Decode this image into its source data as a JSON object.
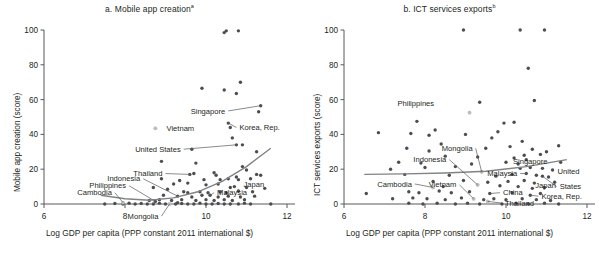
{
  "figure": {
    "xaxis_title": "Log GDP per capita (PPP constant 2011 international $)"
  },
  "chart_data": [
    {
      "type": "scatter",
      "panel": "a",
      "title": "a. Mobile app creation",
      "title_superscript": "a",
      "xlabel": "Log GDP per capita (PPP constant 2011 international $)",
      "ylabel": "Mobile app creation (score)",
      "xlim": [
        6,
        12
      ],
      "ylim": [
        0,
        100
      ],
      "xticks": [
        6,
        8,
        10,
        12
      ],
      "yticks": [
        0,
        20,
        40,
        60,
        80,
        100
      ],
      "grid": false,
      "legend": "none",
      "marker_color": "#4d4d4f",
      "highlight_color": "#bcbec0",
      "trendline_color": "#808285",
      "trendline": {
        "note": "fitted upward-curving trend",
        "x": [
          7.4,
          8.0,
          8.6,
          9.2,
          9.8,
          10.4,
          11.0,
          11.6
        ],
        "y": [
          5.0,
          3.0,
          2.2,
          3.5,
          7.0,
          13.0,
          21.5,
          32.0
        ]
      },
      "annotations": [
        {
          "label": "Singapore",
          "x": 11.35,
          "y": 56.5,
          "lx": 10.55,
          "ly": 53.5,
          "leader": true
        },
        {
          "label": "Korea, Rep.",
          "x": 10.55,
          "y": 46.5,
          "lx": 10.75,
          "ly": 44.0,
          "leader": true
        },
        {
          "label": "Vietnam",
          "x": 8.75,
          "y": 43.5,
          "lx": 8.95,
          "ly": 43.5,
          "leader": false,
          "muted": true
        },
        {
          "label": "United States",
          "x": 10.75,
          "y": 34.0,
          "lx": 9.45,
          "ly": 31.5,
          "leader": true
        },
        {
          "label": "Thailand",
          "x": 9.6,
          "y": 17.0,
          "lx": 9.0,
          "ly": 17.5,
          "leader": true
        },
        {
          "label": "Indonesia",
          "x": 9.3,
          "y": 4.5,
          "lx": 8.45,
          "ly": 14.5,
          "leader": true
        },
        {
          "label": "Philippines",
          "x": 8.75,
          "y": 1.5,
          "lx": 8.1,
          "ly": 10.5,
          "leader": true
        },
        {
          "label": "Cambodia",
          "x": 7.95,
          "y": 0.8,
          "lx": 7.75,
          "ly": 6.5,
          "leader": true
        },
        {
          "label": "Japan",
          "x": 10.6,
          "y": 9.5,
          "lx": 10.85,
          "ly": 11.0,
          "leader": false
        },
        {
          "label": "Malaysia",
          "x": 10.1,
          "y": 5.0,
          "lx": 10.2,
          "ly": 6.5,
          "leader": true
        },
        {
          "label": "Mongolia",
          "x": 9.1,
          "y": 0.0,
          "lx": 8.9,
          "ly": -7.0,
          "leader": true
        }
      ],
      "points": [
        [
          10.45,
          98.5
        ],
        [
          10.5,
          99.5
        ],
        [
          10.8,
          99.5
        ],
        [
          9.9,
          66.5
        ],
        [
          10.45,
          65.5
        ],
        [
          10.85,
          70.0
        ],
        [
          10.75,
          63.5
        ],
        [
          11.35,
          56.5
        ],
        [
          11.3,
          53.0
        ],
        [
          10.55,
          46.5
        ],
        [
          10.6,
          44.0
        ],
        [
          8.75,
          43.5
        ],
        [
          10.65,
          38.0
        ],
        [
          10.9,
          34.0
        ],
        [
          10.75,
          34.0
        ],
        [
          9.65,
          31.5
        ],
        [
          11.25,
          30.0
        ],
        [
          8.9,
          24.5
        ],
        [
          9.75,
          23.5
        ],
        [
          10.9,
          21.5
        ],
        [
          11.0,
          19.5
        ],
        [
          11.25,
          17.0
        ],
        [
          11.35,
          16.5
        ],
        [
          9.6,
          17.0
        ],
        [
          9.7,
          17.5
        ],
        [
          10.2,
          18.0
        ],
        [
          10.25,
          16.5
        ],
        [
          8.9,
          14.5
        ],
        [
          9.35,
          13.5
        ],
        [
          9.95,
          14.0
        ],
        [
          10.35,
          14.0
        ],
        [
          10.55,
          14.5
        ],
        [
          10.75,
          15.5
        ],
        [
          10.8,
          14.0
        ],
        [
          11.1,
          14.5
        ],
        [
          9.2,
          11.5
        ],
        [
          9.55,
          12.0
        ],
        [
          10.0,
          11.0
        ],
        [
          10.3,
          11.5
        ],
        [
          10.6,
          9.5
        ],
        [
          10.7,
          10.0
        ],
        [
          11.0,
          9.5
        ],
        [
          11.45,
          9.0
        ],
        [
          8.7,
          9.5
        ],
        [
          9.05,
          8.5
        ],
        [
          9.45,
          7.0
        ],
        [
          9.55,
          6.5
        ],
        [
          9.85,
          7.0
        ],
        [
          10.05,
          6.5
        ],
        [
          10.35,
          7.0
        ],
        [
          10.5,
          6.5
        ],
        [
          10.8,
          7.5
        ],
        [
          11.15,
          7.0
        ],
        [
          8.95,
          5.0
        ],
        [
          9.3,
          4.5
        ],
        [
          9.65,
          4.0
        ],
        [
          9.9,
          5.0
        ],
        [
          10.1,
          5.0
        ],
        [
          10.3,
          4.0
        ],
        [
          10.55,
          4.5
        ],
        [
          10.85,
          4.0
        ],
        [
          11.2,
          4.5
        ],
        [
          8.6,
          2.0
        ],
        [
          8.85,
          2.5
        ],
        [
          9.15,
          2.0
        ],
        [
          9.4,
          2.5
        ],
        [
          9.75,
          2.0
        ],
        [
          10.0,
          2.5
        ],
        [
          10.2,
          2.0
        ],
        [
          10.45,
          2.5
        ],
        [
          10.65,
          2.0
        ],
        [
          10.95,
          2.5
        ],
        [
          7.5,
          0.0
        ],
        [
          7.75,
          0.3
        ],
        [
          7.95,
          0.0
        ],
        [
          8.1,
          0.5
        ],
        [
          8.25,
          0.0
        ],
        [
          8.4,
          0.3
        ],
        [
          8.55,
          0.0
        ],
        [
          8.7,
          0.0
        ],
        [
          8.85,
          0.5
        ],
        [
          9.0,
          0.0
        ],
        [
          9.1,
          0.0
        ],
        [
          9.25,
          0.0
        ],
        [
          9.4,
          0.3
        ],
        [
          9.55,
          0.0
        ],
        [
          9.7,
          0.0
        ],
        [
          9.85,
          0.5
        ],
        [
          10.0,
          0.0
        ],
        [
          10.15,
          0.0
        ],
        [
          10.3,
          0.3
        ],
        [
          10.45,
          0.0
        ],
        [
          10.6,
          0.0
        ],
        [
          10.8,
          0.0
        ],
        [
          10.95,
          0.5
        ],
        [
          11.1,
          0.0
        ],
        [
          11.6,
          0.0
        ],
        [
          8.75,
          1.5
        ],
        [
          9.3,
          0.8
        ]
      ],
      "highlight_points": [
        [
          8.75,
          43.5
        ],
        [
          7.95,
          0.8
        ],
        [
          9.1,
          0.0
        ]
      ]
    },
    {
      "type": "scatter",
      "panel": "b",
      "title": "b. ICT services exports",
      "title_superscript": "b",
      "xlabel": "Log GDP per capita (PPP constant 2011 international $)",
      "ylabel": "ICT services exports (score)",
      "xlim": [
        6,
        12
      ],
      "ylim": [
        0,
        100
      ],
      "xticks": [
        6,
        8,
        10,
        12
      ],
      "yticks": [
        0,
        20,
        40,
        60,
        80,
        100
      ],
      "grid": false,
      "legend": "none",
      "marker_color": "#4d4d4f",
      "highlight_color": "#bcbec0",
      "trendline_color": "#808285",
      "trendline": {
        "note": "fitted nearly flat, slightly rising trend",
        "x": [
          6.5,
          7.5,
          8.5,
          9.5,
          10.5,
          11.5
        ],
        "y": [
          17.0,
          17.3,
          17.8,
          18.8,
          21.5,
          25.5
        ]
      },
      "annotations": [
        {
          "label": "Philippines",
          "x": 9.1,
          "y": 52.5,
          "lx": 8.3,
          "ly": 58.0,
          "leader": false,
          "muted": true
        },
        {
          "label": "Mongolia",
          "x": 9.4,
          "y": 18.5,
          "lx": 9.25,
          "ly": 32.0,
          "leader": true
        },
        {
          "label": "Indonesia",
          "x": 9.3,
          "y": 11.0,
          "lx": 8.6,
          "ly": 25.5,
          "leader": true
        },
        {
          "label": "Singapore",
          "x": 11.35,
          "y": 24.0,
          "lx": 11.1,
          "ly": 24.5,
          "leader": false
        },
        {
          "label": "Malaysia",
          "x": 10.5,
          "y": 17.5,
          "lx": 10.35,
          "ly": 17.5,
          "leader": true
        },
        {
          "label": "United",
          "x": 10.9,
          "y": 16.0,
          "lx": 11.2,
          "ly": 18.5,
          "leader": false
        },
        {
          "label": "States",
          "x": 10.9,
          "y": 16.0,
          "lx": 11.25,
          "ly": 10.0,
          "leader": true
        },
        {
          "label": "Japan",
          "x": 10.65,
          "y": 9.0,
          "lx": 10.65,
          "ly": 10.5,
          "leader": false
        },
        {
          "label": "Korea, Rep.",
          "x": 10.6,
          "y": 5.0,
          "lx": 10.8,
          "ly": 4.5,
          "leader": true
        },
        {
          "label": "China",
          "x": 9.6,
          "y": 6.0,
          "lx": 9.85,
          "ly": 6.5,
          "leader": true
        },
        {
          "label": "Thailand",
          "x": 9.55,
          "y": 1.5,
          "lx": 9.9,
          "ly": 0.5,
          "leader": true
        },
        {
          "label": "Vietnam",
          "x": 9.2,
          "y": 3.0,
          "lx": 8.85,
          "ly": 11.0,
          "leader": true
        },
        {
          "label": "Cambodia",
          "x": 8.2,
          "y": 9.5,
          "lx": 7.75,
          "ly": 11.5,
          "leader": true
        }
      ],
      "points": [
        [
          8.95,
          100.0
        ],
        [
          10.35,
          100.0
        ],
        [
          10.95,
          100.0
        ],
        [
          10.55,
          78.0
        ],
        [
          9.35,
          58.5
        ],
        [
          10.7,
          59.5
        ],
        [
          9.1,
          52.5
        ],
        [
          7.8,
          47.5
        ],
        [
          9.95,
          46.5
        ],
        [
          7.65,
          40.5
        ],
        [
          10.2,
          47.0
        ],
        [
          6.85,
          41.0
        ],
        [
          8.25,
          42.5
        ],
        [
          8.1,
          39.5
        ],
        [
          9.0,
          40.0
        ],
        [
          9.8,
          41.5
        ],
        [
          8.4,
          34.5
        ],
        [
          9.65,
          38.0
        ],
        [
          10.4,
          36.0
        ],
        [
          11.3,
          33.5
        ],
        [
          7.55,
          32.0
        ],
        [
          8.1,
          30.5
        ],
        [
          9.5,
          32.0
        ],
        [
          10.1,
          33.0
        ],
        [
          10.65,
          31.5
        ],
        [
          10.85,
          28.5
        ],
        [
          11.0,
          30.0
        ],
        [
          10.45,
          28.0
        ],
        [
          8.5,
          27.5
        ],
        [
          9.3,
          27.0
        ],
        [
          10.2,
          26.5
        ],
        [
          10.5,
          25.5
        ],
        [
          11.35,
          24.0
        ],
        [
          7.35,
          24.0
        ],
        [
          7.9,
          23.5
        ],
        [
          9.15,
          23.0
        ],
        [
          10.0,
          24.0
        ],
        [
          10.3,
          23.0
        ],
        [
          7.15,
          20.0
        ],
        [
          8.0,
          21.0
        ],
        [
          8.75,
          21.5
        ],
        [
          9.4,
          18.5
        ],
        [
          10.35,
          20.5
        ],
        [
          10.6,
          21.0
        ],
        [
          10.9,
          20.5
        ],
        [
          11.15,
          19.5
        ],
        [
          7.5,
          17.0
        ],
        [
          8.6,
          16.5
        ],
        [
          9.75,
          16.0
        ],
        [
          10.15,
          17.0
        ],
        [
          10.5,
          17.5
        ],
        [
          10.75,
          16.5
        ],
        [
          10.9,
          16.0
        ],
        [
          11.05,
          15.5
        ],
        [
          8.2,
          13.0
        ],
        [
          8.95,
          13.5
        ],
        [
          9.55,
          12.5
        ],
        [
          10.05,
          13.0
        ],
        [
          10.45,
          13.5
        ],
        [
          10.7,
          12.0
        ],
        [
          11.2,
          12.5
        ],
        [
          8.2,
          9.5
        ],
        [
          8.45,
          10.0
        ],
        [
          9.3,
          11.0
        ],
        [
          9.85,
          10.5
        ],
        [
          10.3,
          10.0
        ],
        [
          10.65,
          9.0
        ],
        [
          10.95,
          9.5
        ],
        [
          6.55,
          6.0
        ],
        [
          7.6,
          7.0
        ],
        [
          7.85,
          6.5
        ],
        [
          8.35,
          7.5
        ],
        [
          8.65,
          6.5
        ],
        [
          9.1,
          7.0
        ],
        [
          9.6,
          6.0
        ],
        [
          10.15,
          6.5
        ],
        [
          10.6,
          5.0
        ],
        [
          10.85,
          6.0
        ],
        [
          7.2,
          3.0
        ],
        [
          7.7,
          3.5
        ],
        [
          8.05,
          3.0
        ],
        [
          8.5,
          2.5
        ],
        [
          8.9,
          3.5
        ],
        [
          9.2,
          3.0
        ],
        [
          9.45,
          2.5
        ],
        [
          9.7,
          3.0
        ],
        [
          10.0,
          2.5
        ],
        [
          10.4,
          3.0
        ],
        [
          10.75,
          2.5
        ],
        [
          11.1,
          2.0
        ],
        [
          7.6,
          0.5
        ],
        [
          7.95,
          0.0
        ],
        [
          8.3,
          0.5
        ],
        [
          8.75,
          0.0
        ],
        [
          9.05,
          0.5
        ],
        [
          9.35,
          0.0
        ],
        [
          9.55,
          1.5
        ],
        [
          9.9,
          0.0
        ],
        [
          10.25,
          0.5
        ],
        [
          10.55,
          0.0
        ],
        [
          10.95,
          0.5
        ],
        [
          11.3,
          0.0
        ]
      ],
      "highlight_points": [
        [
          9.1,
          52.5
        ],
        [
          9.4,
          18.5
        ],
        [
          9.3,
          11.0
        ],
        [
          9.2,
          3.0
        ],
        [
          8.2,
          9.5
        ],
        [
          9.55,
          1.5
        ]
      ]
    }
  ]
}
